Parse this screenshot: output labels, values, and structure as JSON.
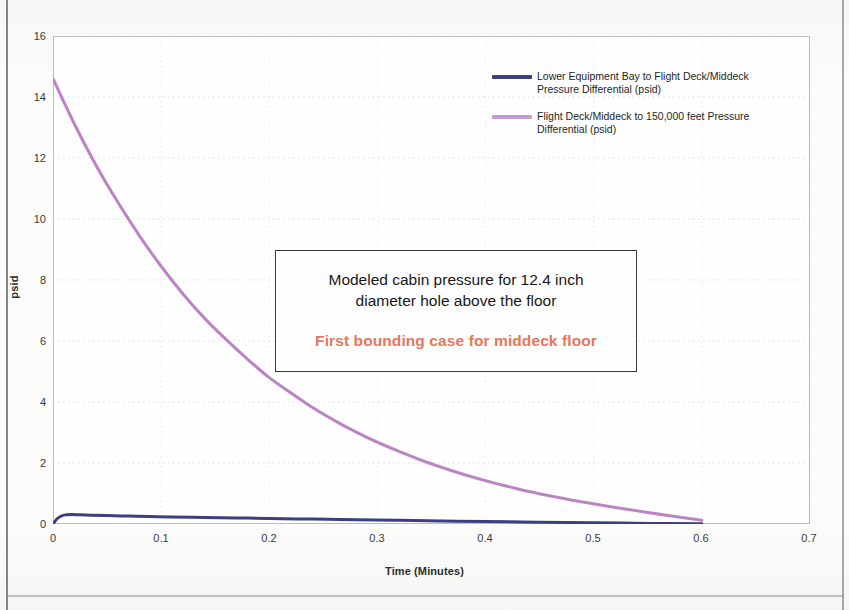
{
  "chart_data": {
    "type": "line",
    "title": "",
    "xlabel": "Time (Minutes)",
    "ylabel": "psid",
    "xlim": [
      0,
      0.7
    ],
    "ylim": [
      0,
      16
    ],
    "xticks": [
      "0",
      "0.1",
      "0.2",
      "0.3",
      "0.4",
      "0.5",
      "0.6",
      "0.7"
    ],
    "yticks": [
      "0",
      "2",
      "4",
      "6",
      "8",
      "10",
      "12",
      "14",
      "16"
    ],
    "grid": "dotted-faint",
    "legend_position": "inside-top-right",
    "series": [
      {
        "name": "Lower Equipment Bay to Flight Deck/Middeck Pressure Differential (psid)",
        "color": "#3b3f7f",
        "x": [
          0,
          0.004,
          0.008,
          0.012,
          0.018,
          0.025,
          0.035,
          0.05,
          0.07,
          0.09,
          0.11,
          0.14,
          0.17,
          0.2,
          0.24,
          0.28,
          0.32,
          0.36,
          0.4,
          0.45,
          0.5,
          0.55,
          0.6
        ],
        "y": [
          0.0,
          0.18,
          0.27,
          0.3,
          0.31,
          0.3,
          0.29,
          0.275,
          0.26,
          0.245,
          0.232,
          0.215,
          0.198,
          0.182,
          0.16,
          0.14,
          0.12,
          0.1,
          0.082,
          0.06,
          0.04,
          0.02,
          0.005
        ]
      },
      {
        "name": "Flight Deck/Middeck to 150,000 feet Pressure Differential (psid)",
        "color": "#c08bc8",
        "x": [
          0,
          0.02,
          0.04,
          0.06,
          0.08,
          0.1,
          0.12,
          0.14,
          0.16,
          0.18,
          0.2,
          0.22,
          0.24,
          0.26,
          0.28,
          0.3,
          0.32,
          0.34,
          0.36,
          0.38,
          0.4,
          0.43,
          0.46,
          0.49,
          0.52,
          0.55,
          0.58,
          0.6
        ],
        "y": [
          14.6,
          13.1,
          11.75,
          10.55,
          9.45,
          8.45,
          7.55,
          6.75,
          6.05,
          5.4,
          4.8,
          4.3,
          3.82,
          3.4,
          3.02,
          2.68,
          2.38,
          2.1,
          1.85,
          1.62,
          1.42,
          1.15,
          0.92,
          0.72,
          0.54,
          0.38,
          0.22,
          0.12
        ]
      }
    ],
    "annotations": [
      {
        "line1": "Modeled cabin pressure for 12.4 inch",
        "line2": "diameter hole above the floor",
        "highlight": "First bounding case for middeck floor",
        "highlight_color": "#e8775a"
      }
    ]
  },
  "axes": {
    "y_title": "psid",
    "x_title": "Time (Minutes)",
    "y_ticks": [
      "16",
      "14",
      "12",
      "10",
      "8",
      "6",
      "4",
      "2",
      "0"
    ],
    "x_ticks": [
      "0",
      "0.1",
      "0.2",
      "0.3",
      "0.4",
      "0.5",
      "0.6",
      "0.7"
    ]
  },
  "legend": {
    "items": [
      {
        "label": "Lower Equipment Bay to Flight Deck/Middeck Pressure Differential (psid)",
        "color": "#3b3f7f"
      },
      {
        "label": "Flight Deck/Middeck to 150,000 feet Pressure Differential (psid)",
        "color": "#c99ad2"
      }
    ]
  },
  "annotation_box": {
    "line1": "Modeled cabin pressure for 12.4 inch",
    "line2": "diameter hole above the floor",
    "highlight": "First bounding case for middeck floor"
  }
}
